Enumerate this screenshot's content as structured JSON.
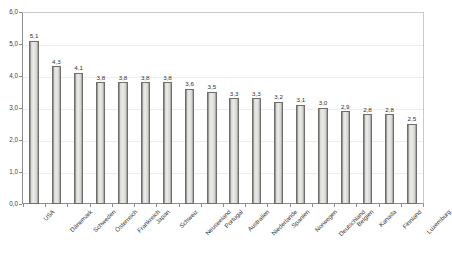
{
  "chart_data": {
    "type": "bar",
    "title": "",
    "subtitle": "",
    "xlabel": "",
    "ylabel": "",
    "ylim": [
      0.0,
      6.0
    ],
    "ytick_labels": [
      "6,0",
      "5,0",
      "4,0",
      "3,0",
      "2,0",
      "1,0",
      "0,0"
    ],
    "ytick_values": [
      6.0,
      5.0,
      4.0,
      3.0,
      2.0,
      1.0,
      0.0
    ],
    "grid": true,
    "grid_axis": "y",
    "legend": false,
    "legend_position": "none",
    "decimal_separator": ",",
    "categories": [
      "USA",
      "Dänemark",
      "Schweden",
      "Österreich",
      "Frankreich",
      "Japan",
      "Schweiz",
      "Neuseeland",
      "Portugal",
      "Australien",
      "Niederlande",
      "Spanien",
      "Norwegen",
      "Deutschland",
      "Belgien",
      "Kanada",
      "Finnland",
      "Luxemburg"
    ],
    "values": [
      5.1,
      4.3,
      4.1,
      3.8,
      3.8,
      3.8,
      3.8,
      3.6,
      3.5,
      3.3,
      3.3,
      3.2,
      3.1,
      3.0,
      2.9,
      2.8,
      2.8,
      2.5
    ],
    "value_labels": [
      "5,1",
      "4,3",
      "4,1",
      "3,8",
      "3,8",
      "3,8",
      "3,8",
      "3,6",
      "3,5",
      "3,3",
      "3,3",
      "3,2",
      "3,1",
      "3,0",
      "2,9",
      "2,8",
      "2,8",
      "2,5"
    ],
    "bar_count": 18,
    "colors": {
      "bar_fill": "#ececeb",
      "bar_edge": "#6e6e6a",
      "axis": "#8d8d8d",
      "grid": "#ededed",
      "text": "#3a3a3a",
      "background": "#ffffff"
    }
  }
}
